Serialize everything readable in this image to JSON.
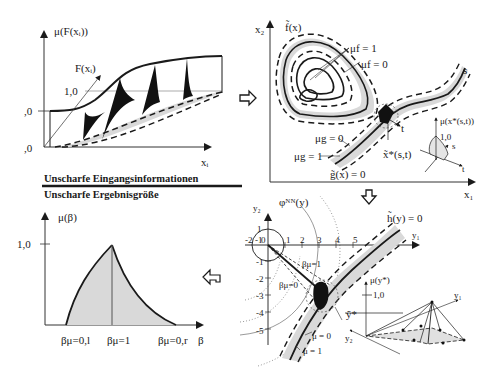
{
  "headings": {
    "input": "Unscharfe Eingangsinformationen",
    "output": "Unscharfe Ergebnisgröße"
  },
  "panel_input": {
    "y_axis_label": "μ(F(xᵢ))",
    "x_axis_label": "xᵢ",
    "curve_label": "F(xᵢ)",
    "tick_inner": "1,0",
    "tick_upper": ",0",
    "tick_lower": ",0"
  },
  "panel_limit_state": {
    "y_axis_label": "x₂",
    "x_axis_label": "x₁",
    "f_label": "f̃(x)",
    "mu_f1": "μf = 1",
    "mu_f0": "μf = 0",
    "mu_g0": "μg = 0",
    "mu_g1": "μg = 1",
    "g_label": "g̃(x) = 0",
    "point_label": "x̃*(s,t)",
    "t_label": "t",
    "s_label": "s",
    "inset_y_label": "μ(x*(s,t))",
    "inset_tick": "1,0",
    "inset_s": "s",
    "inset_t": "t"
  },
  "panel_standard_space": {
    "y_axis_label": "y₂",
    "x_axis_label": "y₁",
    "phi_label": "φᴺᴺ(y)",
    "h_label": "h̃(y) = 0",
    "x_ticks": [
      "-2",
      "-1",
      "0",
      "1",
      "2",
      "3",
      "4",
      "5"
    ],
    "y_ticks": [
      "1",
      "-1",
      "-2",
      "-3",
      "-4",
      "-5"
    ],
    "beta_1": "βμ=1",
    "beta_0": "βμ=0",
    "mu0": "μ = 0",
    "mu1": "μ = 1",
    "ystar_label": "ỹ*",
    "inset_y_label": "μ(y*)",
    "inset_tick": "1,0",
    "inset_y1": "y₁",
    "inset_y2": "y₂"
  },
  "panel_result": {
    "y_axis_label": "μ(β)",
    "x_axis_label": "β",
    "tick_1": "1,0",
    "beta_left": "βμ=0,l",
    "beta_mid": "βμ=1",
    "beta_right": "βμ=0,r"
  },
  "arrows": {
    "right": "arrow-right",
    "down": "arrow-down",
    "left": "arrow-left"
  },
  "colors": {
    "ink": "#1a1a1a",
    "shade": "#d9d9d9",
    "axis": "#333333"
  }
}
